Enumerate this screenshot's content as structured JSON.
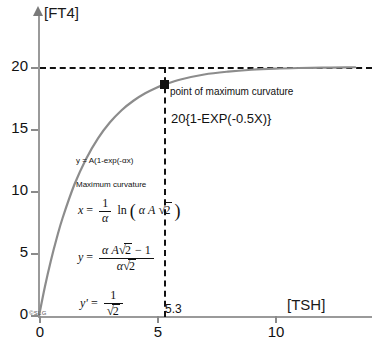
{
  "axes": {
    "y_title": "[FT4]",
    "x_title": "[TSH]",
    "y_ticks": [
      "20",
      "15",
      "10",
      "5",
      "0"
    ],
    "x_ticks": [
      "0",
      "5",
      "10"
    ]
  },
  "annotations": {
    "max_curvature_point": "point of maximum curvature",
    "model_expression": "20{1-EXP(-0.5X)}",
    "general_model": "y = A(1-exp(-αx)",
    "max_curvature_heading": "Maximum curvature",
    "x_formula_lhs": "x",
    "x_formula_eq": "=",
    "x_formula_num": "1",
    "x_formula_den": "α",
    "x_formula_ln": "ln",
    "x_formula_inner": "α A",
    "x_formula_radicand": "2",
    "y_formula_lhs": "y",
    "y_formula_eq": "=",
    "y_formula_num_a": "α A",
    "y_formula_num_rad": "2",
    "y_formula_num_b": "− 1",
    "y_formula_den_a": "α",
    "y_formula_den_rad": "2",
    "yprime_lhs": "y'",
    "yprime_eq": "=",
    "yprime_num": "1",
    "yprime_den_rad": "2",
    "x_marker_value": "5.3",
    "watermark": "©SLG"
  },
  "colors": {
    "curve": "#8c8c8c",
    "axis": "#9a9a9a",
    "dashed": "#111111",
    "marker": "#111111",
    "text": "#111111",
    "background": "#ffffff"
  },
  "chart_data": {
    "type": "line",
    "title": "",
    "xlabel": "[TSH]",
    "ylabel": "[FT4]",
    "xlim": [
      0,
      13.4
    ],
    "ylim": [
      0,
      22.8
    ],
    "grid": false,
    "legend": "none",
    "equation": "y = 20*(1 - exp(-0.5*x))",
    "asymptote": 20,
    "x_tick_values": [
      0,
      5,
      10
    ],
    "y_tick_values": [
      0,
      5,
      10,
      15,
      20
    ],
    "series": [
      {
        "name": "20{1-EXP(-0.5X)}",
        "x": [
          0,
          0.25,
          0.5,
          0.75,
          1,
          1.5,
          2,
          2.5,
          3,
          3.5,
          4,
          4.5,
          5,
          5.3,
          6,
          7,
          8,
          9,
          10,
          11,
          12,
          13,
          13.4
        ],
        "y": [
          0,
          2.35,
          4.42,
          6.24,
          7.87,
          10.56,
          12.64,
          14.27,
          15.54,
          16.53,
          17.29,
          17.89,
          18.36,
          18.58,
          19.0,
          19.4,
          19.63,
          19.78,
          19.87,
          19.92,
          19.95,
          19.97,
          19.98
        ]
      }
    ],
    "annotated_points": [
      {
        "label": "point of maximum curvature",
        "x": 5.3,
        "y": 18.58
      }
    ]
  }
}
